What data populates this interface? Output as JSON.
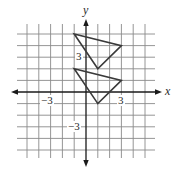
{
  "figure": {
    "type": "coordinate-plane",
    "axes": {
      "x_label": "x",
      "y_label": "y",
      "tick_labels": {
        "x_neg": "−3",
        "x_pos": "3",
        "y_pos": "3",
        "y_neg": "−3"
      },
      "range": {
        "x": [
          -5,
          5
        ],
        "y": [
          -5,
          5
        ]
      },
      "grid": true
    },
    "shapes": [
      {
        "name": "upper-triangle",
        "vertices": [
          [
            -1,
            5
          ],
          [
            3,
            4
          ],
          [
            1,
            2
          ]
        ]
      },
      {
        "name": "lower-triangle",
        "vertices": [
          [
            -1,
            2
          ],
          [
            3,
            1
          ],
          [
            1,
            -1
          ]
        ]
      }
    ],
    "colors": {
      "grid": "#8a8a8a",
      "axis": "#1a1a1a",
      "shape": "#3a3a3a"
    }
  }
}
